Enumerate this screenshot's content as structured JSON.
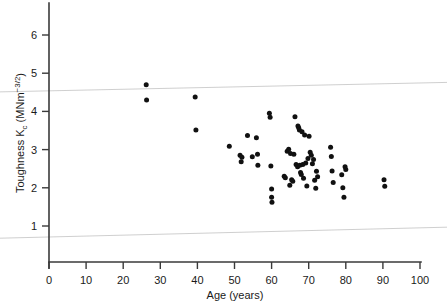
{
  "figure": {
    "background_color": "#ffffff",
    "point_color": "#111111",
    "axis_color": "#3a3a3a",
    "artifact_color": "#c9c9c9"
  },
  "axes": {
    "x_title": "Age (years)",
    "y_title_main": "Toughness K",
    "y_title_sub": "c",
    "y_title_unit_open": " (MNm",
    "y_title_unit_sup": "−3/2",
    "y_title_unit_close": ")",
    "x_ticks": [
      "0",
      "10",
      "20",
      "30",
      "40",
      "50",
      "60",
      "70",
      "80",
      "90",
      "100"
    ],
    "y_ticks": [
      "1",
      "2",
      "3",
      "4",
      "5",
      "6"
    ]
  },
  "chart_data": {
    "type": "scatter",
    "title": "",
    "xlabel": "Age (years)",
    "ylabel": "Toughness Kc (MNm^-3/2)",
    "xlim": [
      0,
      100
    ],
    "ylim": [
      0,
      6.8
    ],
    "xticks": [
      0,
      10,
      20,
      30,
      40,
      50,
      60,
      70,
      80,
      90,
      100
    ],
    "yticks": [
      1,
      2,
      3,
      4,
      5,
      6
    ],
    "grid": false,
    "legend": "none",
    "marker": "filled-circle",
    "n_points": 64,
    "x": [
      26.2,
      26.3,
      39.4,
      39.6,
      48.6,
      51.5,
      51.8,
      52.0,
      53.5,
      54.8,
      55.9,
      56.2,
      56.3,
      59.4,
      59.6,
      59.8,
      60.0,
      60.0,
      60.1,
      63.4,
      63.7,
      64.2,
      64.6,
      64.9,
      65.1,
      65.4,
      65.7,
      66.0,
      66.3,
      66.6,
      67.0,
      67.1,
      67.3,
      67.5,
      67.6,
      67.8,
      68.0,
      68.2,
      68.4,
      68.6,
      68.9,
      69.2,
      69.5,
      69.8,
      70.1,
      70.4,
      70.7,
      71.0,
      71.3,
      71.6,
      71.9,
      72.1,
      72.4,
      75.9,
      76.1,
      76.3,
      76.6,
      78.9,
      79.2,
      79.5,
      79.8,
      80.0,
      90.3,
      90.5
    ],
    "y": [
      4.7,
      4.3,
      4.38,
      3.51,
      3.09,
      2.85,
      2.68,
      2.8,
      3.37,
      2.81,
      3.31,
      2.88,
      2.59,
      3.95,
      3.85,
      2.57,
      1.97,
      1.75,
      1.62,
      2.3,
      2.26,
      2.96,
      3.01,
      2.07,
      2.9,
      2.21,
      2.17,
      2.88,
      3.86,
      2.61,
      2.55,
      3.62,
      3.57,
      3.51,
      2.59,
      2.4,
      2.35,
      3.47,
      2.61,
      2.25,
      3.38,
      2.65,
      2.05,
      2.77,
      3.35,
      2.93,
      2.85,
      2.63,
      2.74,
      2.2,
      1.99,
      2.43,
      2.29,
      3.06,
      2.82,
      2.44,
      2.14,
      2.34,
      2.0,
      1.75,
      2.55,
      2.48,
      2.21,
      2.04
    ]
  },
  "artifacts": {
    "line_top": {
      "x_left": 0,
      "y_left": 4.55,
      "x_right": 100,
      "y_right": 4.72
    },
    "line_bottom": {
      "x_left": 0,
      "y_left": 0.72,
      "x_right": 100,
      "y_right": 0.93
    }
  }
}
